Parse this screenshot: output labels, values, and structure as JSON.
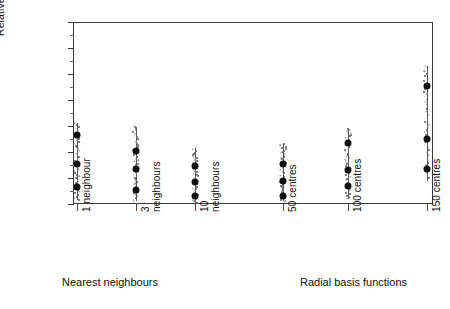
{
  "chart_data": {
    "type": "scatter",
    "title": "",
    "xlabel": "",
    "ylabel": "Relative prediction horizon H",
    "ylabel_plain": "Relative prediction horizon",
    "ylabel_italic": "H",
    "ylim": [
      0,
      0.7
    ],
    "ytick_labels": [
      "0",
      "0.1",
      "0.2",
      "0.3",
      "0.4",
      "0.5",
      "0.6",
      "0.7"
    ],
    "ytick_values": [
      0,
      0.1,
      0.2,
      0.3,
      0.4,
      0.5,
      0.6,
      0.7
    ],
    "grid": false,
    "legend": "none",
    "categories": [
      "1 neighbour",
      "3 neighbours",
      "10 neighbours",
      "50 centres",
      "100 centres",
      "150 centres"
    ],
    "category_lines": [
      [
        "1 neighbour"
      ],
      [
        "3",
        "neighbours"
      ],
      [
        "10",
        "neighbours"
      ],
      [
        "50 centres"
      ],
      [
        "100 centres"
      ],
      [
        "150 centres"
      ]
    ],
    "group_labels": [
      {
        "text": "Nearest neighbours",
        "covers": [
          "1 neighbour",
          "3 neighbours",
          "10 neighbours"
        ]
      },
      {
        "text": "Radial basis functions",
        "covers": [
          "50 centres",
          "100 centres",
          "150 centres"
        ]
      }
    ],
    "series": [
      {
        "name": "upper marker",
        "values": [
          0.265,
          0.205,
          0.145,
          0.155,
          0.235,
          0.455
        ]
      },
      {
        "name": "middle marker",
        "values": [
          0.155,
          0.135,
          0.085,
          0.09,
          0.13,
          0.25
        ]
      },
      {
        "name": "lower marker",
        "values": [
          0.065,
          0.055,
          0.03,
          0.03,
          0.07,
          0.135
        ]
      }
    ],
    "spread": [
      {
        "category": "1 neighbour",
        "min": 0.015,
        "max": 0.31
      },
      {
        "category": "3 neighbours",
        "min": 0.01,
        "max": 0.295
      },
      {
        "category": "10 neighbours",
        "min": 0.005,
        "max": 0.215
      },
      {
        "category": "50 centres",
        "min": 0.01,
        "max": 0.23
      },
      {
        "category": "100 centres",
        "min": 0.02,
        "max": 0.29
      },
      {
        "category": "150 centres",
        "min": 0.09,
        "max": 0.53
      }
    ]
  },
  "colors": {
    "axis": "#3a3a3a",
    "marker": "#111111",
    "cloud": "#5a5a5a",
    "background": "#ffffff"
  }
}
